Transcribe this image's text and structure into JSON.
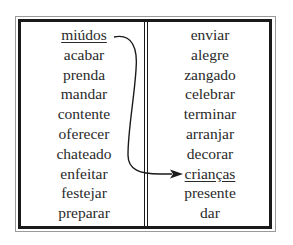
{
  "left_column": {
    "words": [
      "miúdos",
      "acabar",
      "prenda",
      "mandar",
      "contente",
      "oferecer",
      "chateado",
      "enfeitar",
      "festejar",
      "preparar"
    ],
    "underlined_index": 0
  },
  "right_column": {
    "words": [
      "enviar",
      "alegre",
      "zangado",
      "celebrar",
      "terminar",
      "arranjar",
      "decorar",
      "crianças",
      "presente",
      "dar"
    ],
    "underlined_index": 7
  },
  "connector": {
    "from": "miúdos",
    "to": "crianças",
    "icon": "curved-arrow-icon",
    "color": "#1a1a1a"
  }
}
